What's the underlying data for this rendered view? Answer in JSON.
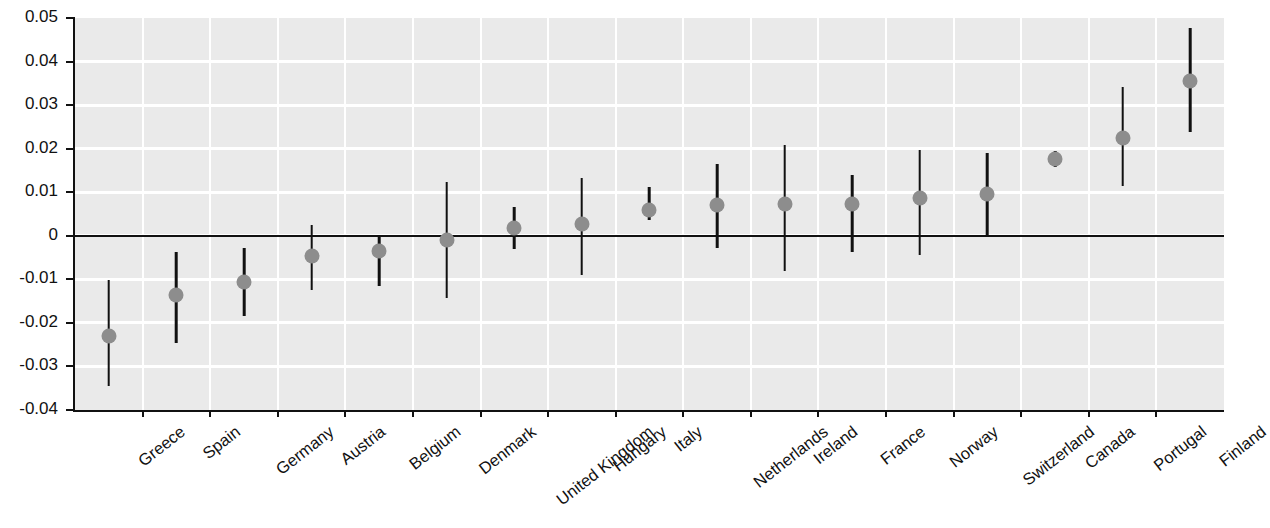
{
  "chart_data": {
    "type": "scatter",
    "title": "",
    "subtitle": "",
    "xlabel": "",
    "ylabel": "",
    "ylim": [
      -0.04,
      0.05
    ],
    "ytick_labels": [
      "0.05",
      "0.04",
      "0.03",
      "0.02",
      "0.01",
      "0",
      "-0.01",
      "-0.02",
      "-0.03",
      "-0.04"
    ],
    "ytick_values": [
      0.05,
      0.04,
      0.03,
      0.02,
      0.01,
      0,
      -0.01,
      -0.02,
      -0.03,
      -0.04
    ],
    "grid": true,
    "legend": "none",
    "zero_reference_line": 0,
    "marker": "filled-circle",
    "marker_color": "#8d8d8d",
    "error_bar_color": "#111111",
    "plot_background": "#eaeaea",
    "gridline_color": "#ffffff",
    "categories": [
      "Greece",
      "Spain",
      "Germany",
      "Austria",
      "Belgium",
      "Denmark",
      "United Kingdom",
      "Hungary",
      "Italy",
      "Netherlands",
      "Ireland",
      "France",
      "Norway",
      "Switzerland",
      "Canada",
      "Portugal",
      "Finland"
    ],
    "values": [
      -0.023,
      -0.0137,
      -0.0106,
      -0.0047,
      -0.0035,
      -0.001,
      0.0018,
      0.0028,
      0.006,
      0.007,
      0.0072,
      0.0073,
      0.0086,
      0.0096,
      0.0177,
      0.0224,
      0.0356
    ],
    "error_low": [
      -0.0345,
      -0.0246,
      -0.0185,
      -0.0124,
      -0.0115,
      -0.0144,
      -0.0031,
      -0.0091,
      0.0036,
      -0.0027,
      -0.008,
      -0.0037,
      -0.0045,
      -0.0002,
      0.0159,
      0.0114,
      0.0238
    ],
    "error_high": [
      -0.0101,
      -0.0038,
      -0.0027,
      0.0025,
      -0.0003,
      0.0123,
      0.0067,
      0.0133,
      0.0111,
      0.0165,
      0.0208,
      0.014,
      0.0196,
      0.0189,
      0.0194,
      0.0341,
      0.0478
    ],
    "series": [
      {
        "name": "point estimate with 95% confidence interval",
        "values": [
          -0.023,
          -0.0137,
          -0.0106,
          -0.0047,
          -0.0035,
          -0.001,
          0.0018,
          0.0028,
          0.006,
          0.007,
          0.0072,
          0.0073,
          0.0086,
          0.0096,
          0.0177,
          0.0224,
          0.0356
        ]
      }
    ]
  }
}
